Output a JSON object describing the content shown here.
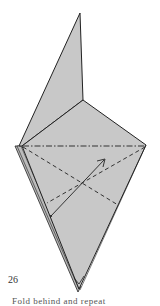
{
  "step": {
    "number": "26",
    "caption": "Fold behind and repeat"
  },
  "colors": {
    "paper": "#c8c8c8",
    "outline": "#222222",
    "background": "#ffffff"
  },
  "diagram": {
    "lines": [
      {
        "type": "mountain-fold",
        "style": "dash-dot",
        "label": "horizontal fold line"
      },
      {
        "type": "valley-fold",
        "style": "dashed",
        "label": "left diagonal crease"
      },
      {
        "type": "valley-fold",
        "style": "dashed",
        "label": "right diagonal crease"
      },
      {
        "type": "arrow",
        "label": "fold direction arrow"
      }
    ]
  }
}
